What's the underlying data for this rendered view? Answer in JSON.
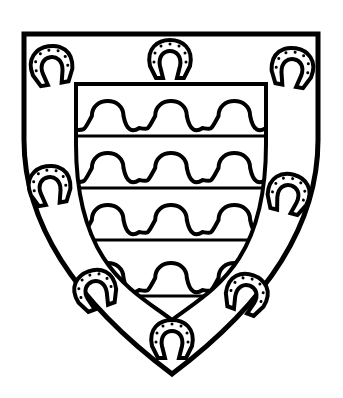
{
  "image": {
    "width": 343,
    "height": 398,
    "background": "#ffffff",
    "ink": "#000000"
  },
  "shield": {
    "outer": {
      "left": 24,
      "right": 318,
      "top": 34,
      "chief_y": 140,
      "point_x": 172,
      "point_y": 374
    },
    "inner": {
      "left": 76,
      "right": 266,
      "top": 84,
      "point_x": 172,
      "point_y": 320
    },
    "bars_y": [
      136,
      188,
      240,
      296
    ],
    "wave_rows_y": [
      100,
      152,
      204,
      262
    ],
    "waves_per_row": 3
  },
  "horseshoes": [
    {
      "name": "horseshoe-top-left",
      "x": 52,
      "y": 68,
      "rot": -10
    },
    {
      "name": "horseshoe-top-center",
      "x": 170,
      "y": 62,
      "rot": 0
    },
    {
      "name": "horseshoe-top-right",
      "x": 292,
      "y": 70,
      "rot": 10
    },
    {
      "name": "horseshoe-mid-left",
      "x": 50,
      "y": 188,
      "rot": -10
    },
    {
      "name": "horseshoe-mid-right",
      "x": 288,
      "y": 196,
      "rot": 15
    },
    {
      "name": "horseshoe-low-left",
      "x": 96,
      "y": 292,
      "rot": -20
    },
    {
      "name": "horseshoe-low-right",
      "x": 246,
      "y": 296,
      "rot": 20
    },
    {
      "name": "horseshoe-bottom",
      "x": 172,
      "y": 342,
      "rot": 0
    }
  ]
}
